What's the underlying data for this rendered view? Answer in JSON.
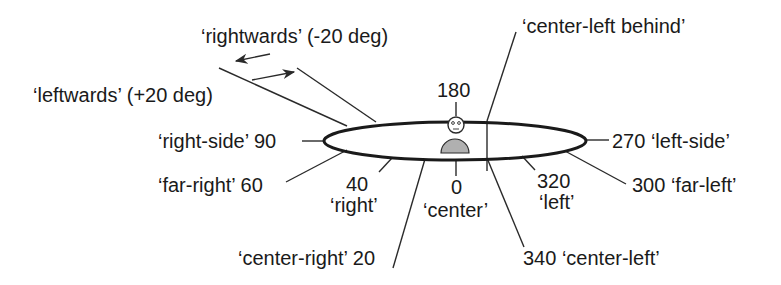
{
  "diagram": {
    "title": "",
    "arrows": {
      "rightwards": "‘rightwards’ (-20 deg)",
      "leftwards": "‘leftwards’ (+20 deg)"
    },
    "directions": [
      {
        "id": "center-left-behind",
        "label": "‘center-left behind’"
      },
      {
        "id": "deg-180",
        "label": "180"
      },
      {
        "id": "right-side",
        "label": "‘right-side’ 90"
      },
      {
        "id": "left-side",
        "label": "270 ‘left-side’"
      },
      {
        "id": "far-right",
        "label": "‘far-right’ 60"
      },
      {
        "id": "far-left",
        "label": "300 ‘far-left’"
      },
      {
        "id": "right-num",
        "label": "40"
      },
      {
        "id": "right-word",
        "label": "‘right’"
      },
      {
        "id": "center-num",
        "label": "0"
      },
      {
        "id": "center-word",
        "label": "‘center’"
      },
      {
        "id": "left-num",
        "label": "320"
      },
      {
        "id": "left-word",
        "label": "‘left’"
      },
      {
        "id": "center-right",
        "label": "‘center-right’ 20"
      },
      {
        "id": "center-left",
        "label": "340 ‘center-left’"
      }
    ],
    "colors": {
      "line": "#2a2a2a",
      "body_fill": "#b0b0b0",
      "text": "#1a1a1a"
    }
  }
}
